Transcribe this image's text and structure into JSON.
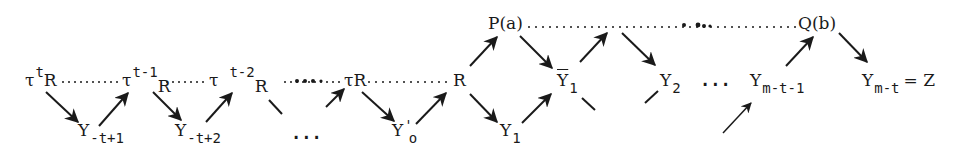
{
  "diagram": {
    "nodes": {
      "tau_t_R": {
        "base": "τ",
        "sup": "t",
        "tail": "R"
      },
      "tau_t1_R": {
        "base": "τ",
        "sup": "t-1",
        "tail": "R"
      },
      "tau_t2_R": {
        "base": "τ",
        "sup": "t-2",
        "tail": "R"
      },
      "tau_R": {
        "label": "τR"
      },
      "R": {
        "label": "R"
      },
      "P_a": {
        "label": "P(a)"
      },
      "Q_b": {
        "label": "Q(b)"
      },
      "Y_neg_t_1": {
        "base": "Y",
        "sub": "-t+1"
      },
      "Y_neg_t_2": {
        "base": "Y",
        "sub": "-t+2"
      },
      "Y_prime_o": {
        "base": "Y",
        "mark": "'",
        "sub": "o"
      },
      "Y_1": {
        "base": "Y",
        "sub": "1"
      },
      "Y_bar_1": {
        "base": "Y",
        "sub": "1",
        "overline": true
      },
      "Y_2": {
        "base": "Y",
        "sub": "2"
      },
      "Y_m_t_1": {
        "base": "Y",
        "sub": "m-t-1"
      },
      "Y_m_t": {
        "base": "Y",
        "sub": "m-t",
        "suffix": "= Z"
      }
    },
    "ellipses": {
      "bottom_left": "...",
      "middle_right": "..."
    },
    "edges": [
      {
        "from": "τ^t R",
        "to": "Y_{-t+1}",
        "style": "arrow"
      },
      {
        "from": "Y_{-t+1}",
        "to": "τ^{t-1}",
        "style": "arrow"
      },
      {
        "from": "τ^{t-1} R",
        "to": "Y_{-t+2}",
        "style": "arrow"
      },
      {
        "from": "Y_{-t+2}",
        "to": "τ^{t-2}",
        "style": "arrow"
      },
      {
        "from": "τR",
        "to": "Y'_o",
        "style": "arrow"
      },
      {
        "from": "Y'_o",
        "to": "R",
        "style": "arrow"
      },
      {
        "from": "R",
        "to": "P(a)",
        "style": "arrow"
      },
      {
        "from": "R",
        "to": "Y_1",
        "style": "arrow"
      },
      {
        "from": "P(a)",
        "to": "Ȳ_1",
        "style": "arrow"
      },
      {
        "from": "Y_1",
        "to": "Ȳ_1",
        "style": "arrow"
      },
      {
        "from": "Ȳ_1",
        "to": "top dotted line",
        "style": "arrow"
      },
      {
        "from": "top dotted line",
        "to": "Y_2",
        "style": "arrow"
      },
      {
        "from": "Y_{m-t-1}",
        "to": "Q(b)",
        "style": "arrow"
      },
      {
        "from": "Q(b)",
        "to": "Y_{m-t}",
        "style": "arrow"
      },
      {
        "from": "below",
        "to": "Y_{m-t-1}",
        "style": "arrow"
      }
    ],
    "dotted_connections": [
      {
        "from": "τ^t R",
        "to": "τ^{t-1}"
      },
      {
        "from": "τ^{t-1} R",
        "to": "τ"
      },
      {
        "from": "τ^{t-2} R",
        "to": "τR"
      },
      {
        "from": "τR",
        "to": "R"
      },
      {
        "from": "P(a)",
        "to": "Q(b)"
      }
    ]
  }
}
